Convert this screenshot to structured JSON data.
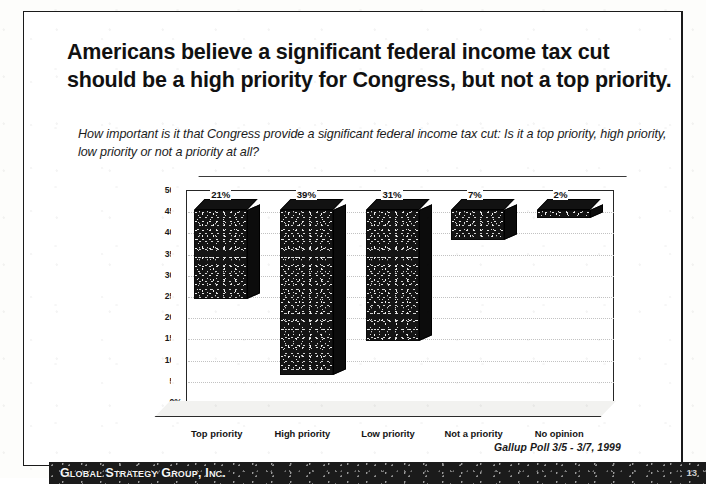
{
  "slide": {
    "title": "Americans believe a significant federal income tax cut should be a high priority for Congress, but not a top priority.",
    "subtitle": "How important is it that Congress provide a significant federal income tax cut: Is it a top priority, high priority, low priority or not a priority at all?",
    "source": "Gallup Poll 3/5 - 3/7, 1999"
  },
  "footer": {
    "organization": "Global Strategy Group, Inc.",
    "page_number": "13"
  },
  "chart_data": {
    "type": "bar",
    "title": "",
    "xlabel": "",
    "ylabel": "Percentage of respondents",
    "categories": [
      "Top priority",
      "High priority",
      "Low priority",
      "Not a priority",
      "No opinion"
    ],
    "values": [
      21,
      39,
      31,
      7,
      2
    ],
    "value_labels": [
      "21%",
      "39%",
      "31%",
      "7%",
      "2%"
    ],
    "ylim": [
      0,
      50
    ],
    "ytick_step": 5,
    "ytick_labels": [
      "50%",
      "45%",
      "40%",
      "35%",
      "30%",
      "25%",
      "20%",
      "15%",
      "10%",
      "5%",
      "0%"
    ],
    "grid": true,
    "legend": false,
    "style": "3d-column",
    "series": [
      {
        "name": "Percentage of respondents",
        "values": [
          21,
          39,
          31,
          7,
          2
        ]
      }
    ],
    "colors": {
      "bar_fill": "#141414",
      "bar_side": "#0c0c0c",
      "axis": "#262626",
      "grid": "#c2c2c2",
      "label_box_bg": "#111111",
      "label_box_text": "#ffffff"
    }
  }
}
